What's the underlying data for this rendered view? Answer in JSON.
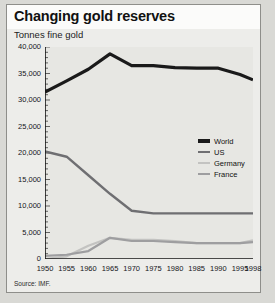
{
  "header": {
    "title": "Changing gold reserves",
    "subtitle": "Tonnes fine gold"
  },
  "footer": {
    "source": "Source: IMF."
  },
  "legend": {
    "items": [
      {
        "label": "World",
        "color": "#1a1a1a",
        "thickness": 3.2
      },
      {
        "label": "US",
        "color": "#6f6f72",
        "thickness": 2.4
      },
      {
        "label": "Germany",
        "color": "#c3c3c1",
        "thickness": 2.2
      },
      {
        "label": "France",
        "color": "#9e9ea0",
        "thickness": 2.2
      }
    ]
  },
  "chart_data": {
    "type": "line",
    "title": "Changing gold reserves",
    "subtitle": "Tonnes fine gold",
    "xlabel": "",
    "ylabel": "Tonnes fine gold",
    "source": "Source: IMF.",
    "grid": false,
    "legend_position": "right-middle",
    "xlim": [
      1950,
      1998
    ],
    "ylim": [
      0,
      40000
    ],
    "ytick_step": 5000,
    "yticks": [
      0,
      5000,
      10000,
      15000,
      20000,
      25000,
      30000,
      35000,
      40000
    ],
    "ytick_labels": [
      "0",
      "5,000",
      "10,000",
      "15,000",
      "20,000",
      "25,000",
      "30,000",
      "35,000",
      "40,000"
    ],
    "xticks": [
      1950,
      1955,
      1960,
      1965,
      1970,
      1975,
      1980,
      1985,
      1990,
      1995,
      1998
    ],
    "xtick_labels": [
      "1950",
      "1955",
      "1960",
      "1965",
      "1970",
      "1975",
      "1980",
      "1985",
      "1990",
      "1995",
      "1998"
    ],
    "x": [
      1950,
      1955,
      1960,
      1965,
      1970,
      1975,
      1980,
      1985,
      1990,
      1995,
      1998
    ],
    "series": [
      {
        "name": "World",
        "color": "#1a1a1a",
        "thickness": 3.2,
        "values": [
          31500,
          33600,
          35800,
          38700,
          36500,
          36500,
          36100,
          36000,
          36000,
          34800,
          33800
        ]
      },
      {
        "name": "US",
        "color": "#6f6f72",
        "thickness": 2.4,
        "values": [
          20300,
          19300,
          15800,
          12300,
          9100,
          8600,
          8600,
          8600,
          8600,
          8600,
          8600
        ]
      },
      {
        "name": "Germany",
        "color": "#c3c3c1",
        "thickness": 2.2,
        "values": [
          0,
          500,
          2500,
          4000,
          3600,
          3600,
          3400,
          3000,
          3000,
          3000,
          3500
        ]
      },
      {
        "name": "France",
        "color": "#9e9ea0",
        "thickness": 2.2,
        "values": [
          600,
          800,
          1500,
          4000,
          3400,
          3400,
          3200,
          3000,
          3000,
          3000,
          3200
        ]
      }
    ]
  }
}
